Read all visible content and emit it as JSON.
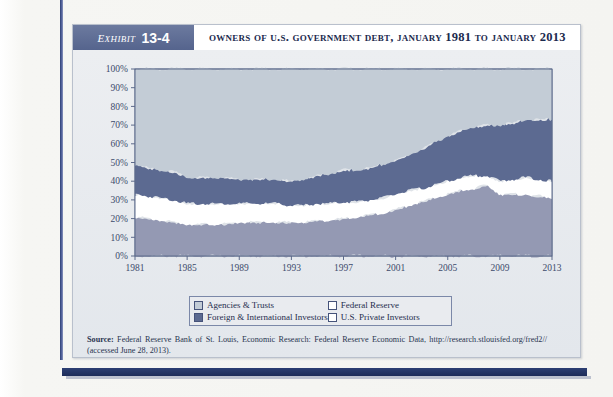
{
  "exhibit": {
    "tag_word": "Exhibit",
    "tag_number": "13-4",
    "title": "Owners of U.S. Government Debt, January 1981 to January 2013"
  },
  "legend": {
    "items": [
      {
        "label": "Agencies & Trusts",
        "swatch": "agencies",
        "color": "#c3ccd6"
      },
      {
        "label": "Federal Reserve",
        "swatch": "fed",
        "color": "#ffffff"
      },
      {
        "label": "Foreign & International Investors",
        "swatch": "foreign",
        "color": "#5c6a91"
      },
      {
        "label": "U.S. Private Investors",
        "swatch": "private",
        "color": "#ffffff"
      }
    ]
  },
  "source": {
    "label": "Source:",
    "text": " Federal Reserve Bank of St. Louis, Economic Research: Federal Reserve Economic Data, http://research.stlouisfed.org/fred2// (accessed June 28, 2013)."
  },
  "chart_data": {
    "type": "area",
    "title": "Owners of U.S. Government Debt, January 1981 to January 2013",
    "xlabel": "",
    "ylabel": "",
    "stacked": true,
    "stack_order_bottom_to_top": [
      "U.S. Private Investors",
      "Federal Reserve",
      "Foreign & International Investors",
      "Agencies & Trusts"
    ],
    "xlim": [
      1981,
      2013
    ],
    "ylim": [
      0,
      100
    ],
    "yticks": [
      "0%",
      "10%",
      "20%",
      "30%",
      "40%",
      "50%",
      "60%",
      "70%",
      "80%",
      "90%",
      "100%"
    ],
    "ytick_values": [
      0,
      10,
      20,
      30,
      40,
      50,
      60,
      70,
      80,
      90,
      100
    ],
    "xticks": [
      "1981",
      "1985",
      "1989",
      "1993",
      "1997",
      "2001",
      "2005",
      "2009",
      "2013"
    ],
    "xtick_values": [
      1981,
      1985,
      1989,
      1993,
      1997,
      2001,
      2005,
      2009,
      2013
    ],
    "grid": false,
    "legend_position": "below",
    "x": [
      1981,
      1982,
      1983,
      1984,
      1985,
      1986,
      1987,
      1988,
      1989,
      1990,
      1991,
      1992,
      1993,
      1994,
      1995,
      1996,
      1997,
      1998,
      1999,
      2000,
      2001,
      2002,
      2003,
      2004,
      2005,
      2006,
      2007,
      2008,
      2009,
      2010,
      2011,
      2012,
      2013
    ],
    "series": [
      {
        "name": "U.S. Private Investors",
        "color": "#9499b3",
        "values": [
          21,
          20,
          19,
          18,
          17,
          17,
          17,
          17,
          18,
          18,
          18,
          18,
          18,
          18,
          19,
          19,
          20,
          21,
          22,
          23,
          25,
          27,
          29,
          31,
          33,
          35,
          36,
          38,
          33,
          33,
          33,
          32,
          31
        ]
      },
      {
        "name": "Federal Reserve",
        "color": "#ffffff",
        "values": [
          12,
          12,
          12,
          12,
          11,
          11,
          11,
          11,
          10,
          10,
          10,
          10,
          9,
          9,
          9,
          9,
          9,
          8,
          8,
          8,
          8,
          8,
          7,
          7,
          7,
          7,
          7,
          5,
          7,
          8,
          9,
          9,
          9
        ]
      },
      {
        "name": "Foreign & International Investors",
        "color": "#5c6a91",
        "values": [
          16,
          15,
          15,
          15,
          14,
          14,
          14,
          14,
          13,
          13,
          13,
          13,
          13,
          14,
          15,
          16,
          17,
          17,
          17,
          18,
          18,
          19,
          21,
          23,
          24,
          25,
          26,
          27,
          30,
          30,
          31,
          32,
          33
        ]
      },
      {
        "name": "Agencies & Trusts",
        "color": "#c3ccd6",
        "values": [
          51,
          53,
          54,
          55,
          58,
          58,
          58,
          58,
          59,
          59,
          59,
          59,
          60,
          59,
          57,
          56,
          54,
          54,
          53,
          51,
          49,
          46,
          43,
          39,
          36,
          33,
          31,
          30,
          30,
          29,
          27,
          27,
          27
        ]
      }
    ],
    "cumulative_top_lines": {
      "note": "cumulative stacked top boundary percentages by year",
      "private_top": [
        21,
        20,
        19,
        18,
        17,
        17,
        17,
        17,
        18,
        18,
        18,
        18,
        18,
        18,
        19,
        19,
        20,
        21,
        22,
        23,
        25,
        27,
        29,
        31,
        33,
        35,
        36,
        38,
        33,
        33,
        33,
        32,
        31
      ],
      "fed_top": [
        33,
        32,
        31,
        30,
        28,
        28,
        28,
        28,
        28,
        28,
        28,
        28,
        27,
        27,
        28,
        28,
        29,
        29,
        30,
        31,
        33,
        35,
        36,
        38,
        40,
        42,
        43,
        43,
        40,
        41,
        42,
        41,
        40
      ],
      "foreign_top": [
        49,
        47,
        46,
        45,
        42,
        42,
        42,
        42,
        41,
        41,
        41,
        41,
        40,
        41,
        43,
        44,
        46,
        46,
        47,
        49,
        51,
        54,
        57,
        61,
        64,
        67,
        69,
        70,
        70,
        71,
        73,
        73,
        73
      ]
    }
  }
}
